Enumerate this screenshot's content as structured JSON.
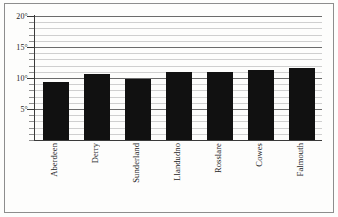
{
  "chart_data": {
    "type": "bar",
    "title": "",
    "subtitle": "",
    "xlabel": "",
    "ylabel": "",
    "categories": [
      "Aberdeen",
      "Derry",
      "Sunderland",
      "Llandudno",
      "Rosslare",
      "Cowes",
      "Falmouth"
    ],
    "values": [
      9.4,
      10.7,
      9.8,
      10.9,
      10.9,
      11.3,
      11.6
    ],
    "ylim": [
      0,
      20
    ],
    "ytick_values": [
      5,
      10,
      15,
      20
    ],
    "ytick_labels": [
      "5°",
      "10°",
      "15°",
      "20°"
    ],
    "minor_tick_step": 1,
    "grid": true,
    "grid_minor": true,
    "legend": "none",
    "bar_color": "#111111",
    "grid_color": "#cfcfcf",
    "major_grid_color": "#6b6b6b",
    "axis_color": "#3a3a3a",
    "frame_color": "#8d8d8d",
    "background_color": "#fdfdfc"
  }
}
